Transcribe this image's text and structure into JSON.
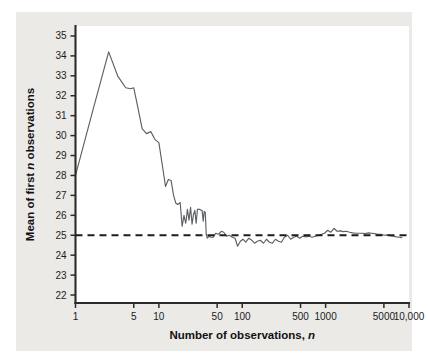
{
  "figure": {
    "background_color": "#ffffff",
    "panel_color": "#eceae7",
    "plot_background": "#ffffff"
  },
  "chart_data": {
    "type": "line",
    "title": "",
    "xlabel_text": "Number of observations, ",
    "xlabel_italic": "n",
    "ylabel_text_a": "Mean of first ",
    "ylabel_italic": "n",
    "ylabel_text_b": " observations",
    "xscale": "log",
    "yscale": "linear",
    "xlim": [
      1,
      10000
    ],
    "ylim": [
      21.6,
      35.5
    ],
    "grid": false,
    "legend": "none",
    "xticks": [
      1,
      5,
      10,
      50,
      100,
      500,
      1000,
      5000,
      10000
    ],
    "xticklabels": [
      "1",
      "5",
      "10",
      "50",
      "100",
      "500",
      "1000",
      "5000",
      "10,000"
    ],
    "yticks": [
      22,
      23,
      24,
      25,
      26,
      27,
      28,
      29,
      30,
      31,
      32,
      33,
      34,
      35
    ],
    "yticklabels": [
      "22",
      "23",
      "24",
      "25",
      "26",
      "27",
      "28",
      "29",
      "30",
      "31",
      "32",
      "33",
      "34",
      "35"
    ],
    "series": [
      {
        "name": "running-mean",
        "style": "solid",
        "color": "#5d6063",
        "x": [
          1,
          1.6,
          2.5,
          3.2,
          4.0,
          4.6,
          5.0,
          5.6,
          6.3,
          7.1,
          8.0,
          9.0,
          10.0,
          11.2,
          12.0,
          13.0,
          14.0,
          15.0,
          16.0,
          17.0,
          18.0,
          19.0,
          20.0,
          21.0,
          22.0,
          23.0,
          24.0,
          25.0,
          26.0,
          27.0,
          28.0,
          29.0,
          30.0,
          31.0,
          32.0,
          33.0,
          34.0,
          35.0,
          36.0,
          37.0,
          38.0,
          40.0,
          42.0,
          45.0,
          48.0,
          52.0,
          56.0,
          60.0,
          65.0,
          70.0,
          76.0,
          82.0,
          88.0,
          95.0,
          102.0,
          110.0,
          120.0,
          130.0,
          140.0,
          152.0,
          165.0,
          180.0,
          195.0,
          212.0,
          230.0,
          250.0,
          272.0,
          295.0,
          320.0,
          350.0,
          380.0,
          415.0,
          450.0,
          490.0,
          530.0,
          580.0,
          630.0,
          690.0,
          750.0,
          820.0,
          890.0,
          970.0,
          1060.0,
          1150.0,
          1260.0,
          1370.0,
          1500.0,
          1630.0,
          1780.0,
          1940.0,
          2120.0,
          2310.0,
          2520.0,
          2740.0,
          3000.0,
          3270.0,
          3560.0,
          3880.0,
          4230.0,
          4610.0,
          5030.0,
          5480.0,
          5980.0,
          6520.0,
          7100.0,
          7750.0,
          8200.0
        ],
        "y": [
          28.0,
          31.2,
          34.2,
          33.0,
          32.4,
          32.35,
          32.4,
          31.4,
          30.35,
          30.1,
          30.2,
          29.8,
          29.65,
          28.3,
          27.45,
          27.8,
          27.75,
          27.0,
          26.6,
          26.55,
          26.65,
          25.45,
          26.0,
          25.6,
          26.3,
          25.75,
          26.4,
          25.55,
          26.05,
          26.25,
          25.6,
          26.3,
          26.3,
          26.3,
          26.25,
          26.25,
          25.7,
          26.2,
          26.15,
          25.05,
          24.85,
          24.95,
          24.9,
          24.9,
          25.1,
          25.05,
          25.2,
          25.15,
          24.95,
          25.0,
          24.9,
          24.85,
          24.45,
          24.7,
          24.8,
          24.65,
          24.85,
          24.75,
          24.6,
          24.7,
          24.75,
          24.6,
          24.8,
          24.65,
          24.6,
          24.8,
          24.7,
          24.65,
          24.9,
          25.0,
          24.8,
          24.9,
          24.95,
          24.85,
          24.95,
          24.92,
          24.95,
          24.9,
          24.95,
          25.0,
          25.05,
          25.1,
          25.25,
          25.15,
          25.35,
          25.2,
          25.22,
          25.18,
          25.2,
          25.15,
          25.12,
          25.1,
          25.1,
          25.1,
          25.08,
          25.12,
          25.1,
          25.08,
          25.05,
          25.05,
          25.0,
          25.02,
          24.98,
          24.95,
          24.92,
          24.9,
          24.88
        ],
        "endpoint_x": 8200
      },
      {
        "name": "reference-mean",
        "style": "dashed",
        "color": "#1d1d1d",
        "constant_y": 25,
        "x_span": [
          1,
          10000
        ]
      }
    ],
    "annotations": []
  }
}
